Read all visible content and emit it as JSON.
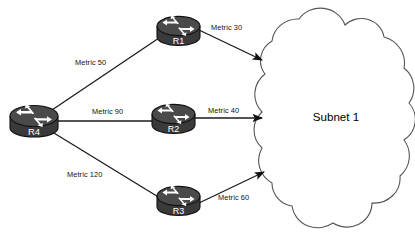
{
  "diagram": {
    "type": "network-topology",
    "background_color": "#ffffff",
    "line_color": "#1a1a1a",
    "router_body_color": "#3a3a3a",
    "router_top_color": "#4a4a4a",
    "router_arrow_color": "#ffffff",
    "cloud_stroke_color": "#555555",
    "cloud_fill_color": "#ffffff"
  },
  "cloud": {
    "label": "Subnet 1",
    "name": "subnet-cloud"
  },
  "routers": [
    {
      "id": "r4",
      "label": "R4",
      "x": 8,
      "y": 104
    },
    {
      "id": "r1",
      "label": "R1",
      "x": 155,
      "y": 15
    },
    {
      "id": "r2",
      "label": "R2",
      "x": 150,
      "y": 103
    },
    {
      "id": "r3",
      "label": "R3",
      "x": 155,
      "y": 185
    }
  ],
  "links": [
    {
      "id": "r4-r1",
      "from": "R4",
      "to": "R1",
      "label": "Metric 50",
      "metric": 50,
      "arrow": false
    },
    {
      "id": "r4-r2",
      "from": "R4",
      "to": "R2",
      "label": "Metric 90",
      "metric": 90,
      "arrow": false
    },
    {
      "id": "r4-r3",
      "from": "R4",
      "to": "R3",
      "label": "Metric 120",
      "metric": 120,
      "arrow": false
    },
    {
      "id": "r1-cloud",
      "from": "R1",
      "to": "Subnet 1",
      "label": "Metric 30",
      "metric": 30,
      "arrow": true
    },
    {
      "id": "r2-cloud",
      "from": "R2",
      "to": "Subnet 1",
      "label": "Metric 40",
      "metric": 40,
      "arrow": true
    },
    {
      "id": "r3-cloud",
      "from": "R3",
      "to": "Subnet 1",
      "label": "Metric 60",
      "metric": 60,
      "arrow": true
    }
  ],
  "labels": {
    "metric_50": {
      "text": "Metric 50",
      "x": 75,
      "y": 59
    },
    "metric_90": {
      "text": "Metric 90",
      "x": 92,
      "y": 108
    },
    "metric_120": {
      "text": "Metric 120",
      "x": 67,
      "y": 171
    },
    "metric_30": {
      "text": "Metric 30",
      "x": 211,
      "y": 24
    },
    "metric_40": {
      "text": "Metric 40",
      "x": 208,
      "y": 107
    },
    "metric_60": {
      "text": "Metric 60",
      "x": 218,
      "y": 194
    }
  }
}
